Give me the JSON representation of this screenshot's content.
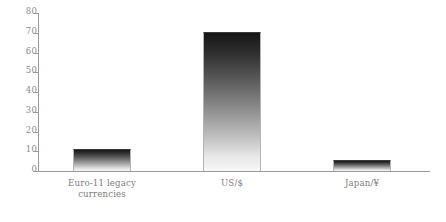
{
  "chart_data": {
    "type": "bar",
    "title": "",
    "subtitle": "",
    "xlabel": "",
    "ylabel": "",
    "categories": [
      "Euro-11 legacy\ncurrencies",
      "US/$",
      "Japan/¥"
    ],
    "values": [
      11,
      70.5,
      5.5
    ],
    "ylim": [
      0,
      80
    ],
    "yticks": [
      0,
      10,
      20,
      30,
      40,
      50,
      60,
      70,
      80
    ],
    "ytick_labels": [
      "0",
      "10",
      "20",
      "30",
      "40",
      "50",
      "60",
      "70",
      "80"
    ],
    "grid": false,
    "legend": null,
    "colors": {
      "bar_top": "#151515",
      "bar_bottom": "#f7f7f7",
      "axis": "#9a9a9a",
      "tick_text": "#8c8c8c",
      "category_text": "#7d7d7d",
      "background": "#ffffff"
    }
  },
  "axis": {
    "y_ticks": [
      {
        "label": "80",
        "value": 80
      },
      {
        "label": "70",
        "value": 70
      },
      {
        "label": "60",
        "value": 60
      },
      {
        "label": "50",
        "value": 50
      },
      {
        "label": "40",
        "value": 40
      },
      {
        "label": "30",
        "value": 30
      },
      {
        "label": "20",
        "value": 20
      },
      {
        "label": "10",
        "value": 10
      },
      {
        "label": "0",
        "value": 0
      }
    ]
  },
  "bars": [
    {
      "label": "Euro-11 legacy\ncurrencies",
      "value": 11
    },
    {
      "label": "US/$",
      "value": 70.5
    },
    {
      "label": "Japan/¥",
      "value": 5.5
    }
  ]
}
